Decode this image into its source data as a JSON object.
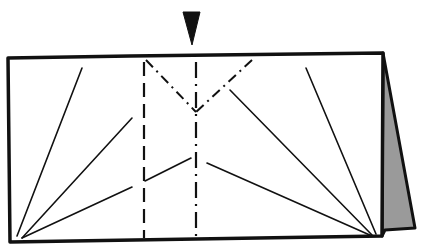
{
  "diagram": {
    "type": "origami-fold-diagram",
    "colors": {
      "ink": "#111111",
      "paper": "#ffffff",
      "flap_fill": "#9a9a9a"
    },
    "elements": {
      "push_arrow": {
        "icon": "downward-triangle-arrow",
        "points": "183,12 200,12 192,45"
      },
      "paper_outline": {
        "points": "8,58 130,56 383,53 382,236 10,242"
      },
      "back_flap": {
        "points": "383,53 415,228 385,230 382,236"
      },
      "valley_fold_left": {
        "x1": 144,
        "y1": 62,
        "x2": 144,
        "y2": 238
      },
      "center_line": {
        "x1": 196,
        "y1": 62,
        "x2": 196,
        "y2": 236
      },
      "mountain_fold_left": {
        "x1": 146,
        "y1": 60,
        "x2": 196,
        "y2": 112
      },
      "mountain_fold_right": {
        "x1": 252,
        "y1": 60,
        "x2": 196,
        "y2": 112
      },
      "crease_lines": [
        {
          "x1": 17,
          "y1": 236,
          "x2": 82,
          "y2": 68
        },
        {
          "x1": 22,
          "y1": 238,
          "x2": 132,
          "y2": 118
        },
        {
          "x1": 22,
          "y1": 238,
          "x2": 132,
          "y2": 187
        },
        {
          "x1": 145,
          "y1": 181,
          "x2": 191,
          "y2": 158
        },
        {
          "x1": 376,
          "y1": 234,
          "x2": 306,
          "y2": 68
        },
        {
          "x1": 372,
          "y1": 235,
          "x2": 230,
          "y2": 90
        },
        {
          "x1": 372,
          "y1": 236,
          "x2": 207,
          "y2": 163
        }
      ]
    }
  }
}
